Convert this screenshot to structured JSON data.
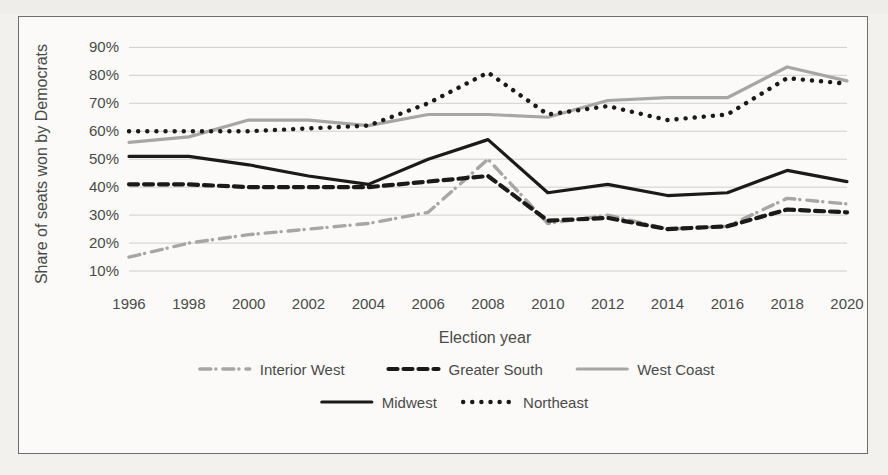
{
  "chart_data": {
    "type": "line",
    "title": "",
    "xlabel": "Election year",
    "ylabel": "Share of seats won by Democrats",
    "x": [
      1996,
      1998,
      2000,
      2002,
      2004,
      2006,
      2008,
      2010,
      2012,
      2014,
      2016,
      2018,
      2020
    ],
    "tick_labels_x": [
      "1996",
      "1998",
      "2000",
      "2002",
      "2004",
      "2006",
      "2008",
      "2010",
      "2012",
      "2014",
      "2016",
      "2018",
      "2020"
    ],
    "tick_labels_y": [
      "10%",
      "20%",
      "30%",
      "40%",
      "50%",
      "60%",
      "70%",
      "80%",
      "90%"
    ],
    "ylim": [
      5,
      93
    ],
    "y_ticks": [
      10,
      20,
      30,
      40,
      50,
      60,
      70,
      80,
      90
    ],
    "grid": true,
    "legend_position": "bottom",
    "series": [
      {
        "name": "Interior West",
        "style": "dash-dot",
        "color": "#a6a6a6",
        "values": [
          15,
          20,
          23,
          25,
          27,
          31,
          50,
          27,
          30,
          25,
          26,
          36,
          34
        ]
      },
      {
        "name": "Greater South",
        "style": "dashed",
        "color": "#1a1a1a",
        "values": [
          41,
          41,
          40,
          40,
          40,
          42,
          44,
          28,
          29,
          25,
          26,
          32,
          31
        ]
      },
      {
        "name": "West Coast",
        "style": "solid",
        "color": "#a6a6a6",
        "values": [
          56,
          58,
          64,
          64,
          62,
          66,
          66,
          65,
          71,
          72,
          72,
          83,
          78
        ]
      },
      {
        "name": "Midwest",
        "style": "solid",
        "color": "#1a1a1a",
        "values": [
          51,
          51,
          48,
          44,
          41,
          50,
          57,
          38,
          41,
          37,
          38,
          46,
          42
        ]
      },
      {
        "name": "Northeast",
        "style": "dotted",
        "color": "#1a1a1a",
        "values": [
          60,
          60,
          60,
          61,
          62,
          70,
          81,
          66,
          69,
          64,
          66,
          79,
          77
        ]
      }
    ]
  },
  "colors": {
    "frame": "#6e6e6e",
    "plot_background": "#fbfaf8",
    "grid": "#c9c9c9",
    "dark_series": "#1a1a1a",
    "light_series": "#a6a6a6",
    "text": "#4a4a4a"
  }
}
